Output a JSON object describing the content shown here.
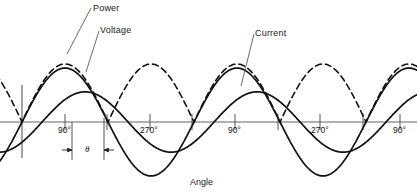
{
  "figure": {
    "width": 417,
    "height": 195,
    "background": "#ffffff",
    "ink_color": "#111111",
    "axis_color": "#555555"
  },
  "labels": {
    "power": "Power",
    "voltage": "Voltage",
    "current": "Current",
    "theta": "θ",
    "axis_title": "Angle"
  },
  "axis": {
    "x_title": "Angle",
    "zero_line_y": 122,
    "origin_x": 22,
    "tick_labels": [
      {
        "text": "90°",
        "x": 65,
        "y": 127
      },
      {
        "text": "270°",
        "x": 150,
        "y": 127
      },
      {
        "text": "90°",
        "x": 235,
        "y": 127
      },
      {
        "text": "270°",
        "x": 320,
        "y": 127
      },
      {
        "text": "90°",
        "x": 400,
        "y": 127
      }
    ],
    "tick_positions_x": [
      22,
      65,
      107,
      150,
      192,
      235,
      278,
      320,
      363,
      400
    ]
  },
  "chart_data": {
    "type": "line",
    "title": "",
    "xlabel": "Angle",
    "ylabel": "",
    "grid": false,
    "legend": "annotated-leaders",
    "x_unit": "degrees",
    "x_range": [
      -20,
      740
    ],
    "y_range": [
      -1.1,
      1.1
    ],
    "xticks": [
      0,
      90,
      180,
      270,
      360,
      450,
      540,
      630,
      720
    ],
    "xticklabels": [
      "",
      "90°",
      "",
      "270°",
      "",
      "90°",
      "",
      "270°",
      "90°"
    ],
    "phase_angle_theta_deg": 42,
    "series": [
      {
        "name": "Power",
        "style": "dashed",
        "amplitude": 1.0,
        "phase_deg": 0,
        "frequency_multiplier": 2,
        "offset": 0,
        "description": "Instantaneous power, double frequency, drawn as dashed curve peaking highest"
      },
      {
        "name": "Voltage",
        "style": "solid",
        "amplitude": 0.93,
        "phase_deg": 0,
        "frequency_multiplier": 1,
        "offset": 0,
        "description": "Applied voltage sinusoid, solid line, full amplitude"
      },
      {
        "name": "Current",
        "style": "solid",
        "amplitude": 0.52,
        "phase_deg": -42,
        "frequency_multiplier": 1,
        "offset": 0,
        "description": "Current sinusoid, solid line, smaller amplitude, lagging voltage by theta"
      }
    ],
    "annotations": [
      {
        "text": "Power",
        "x_px": 93,
        "y_px": 4,
        "leader_to_x": 67,
        "leader_to_y": 54
      },
      {
        "text": "Voltage",
        "x_px": 100,
        "y_px": 26,
        "leader_to_x": 86,
        "leader_to_y": 72
      },
      {
        "text": "Current",
        "x_px": 255,
        "y_px": 29,
        "leader_to_x": 241,
        "leader_to_y": 86
      },
      {
        "text": "θ",
        "x_px": 86,
        "y_px": 146,
        "leader_to_x": 0,
        "leader_to_y": 0
      }
    ]
  }
}
